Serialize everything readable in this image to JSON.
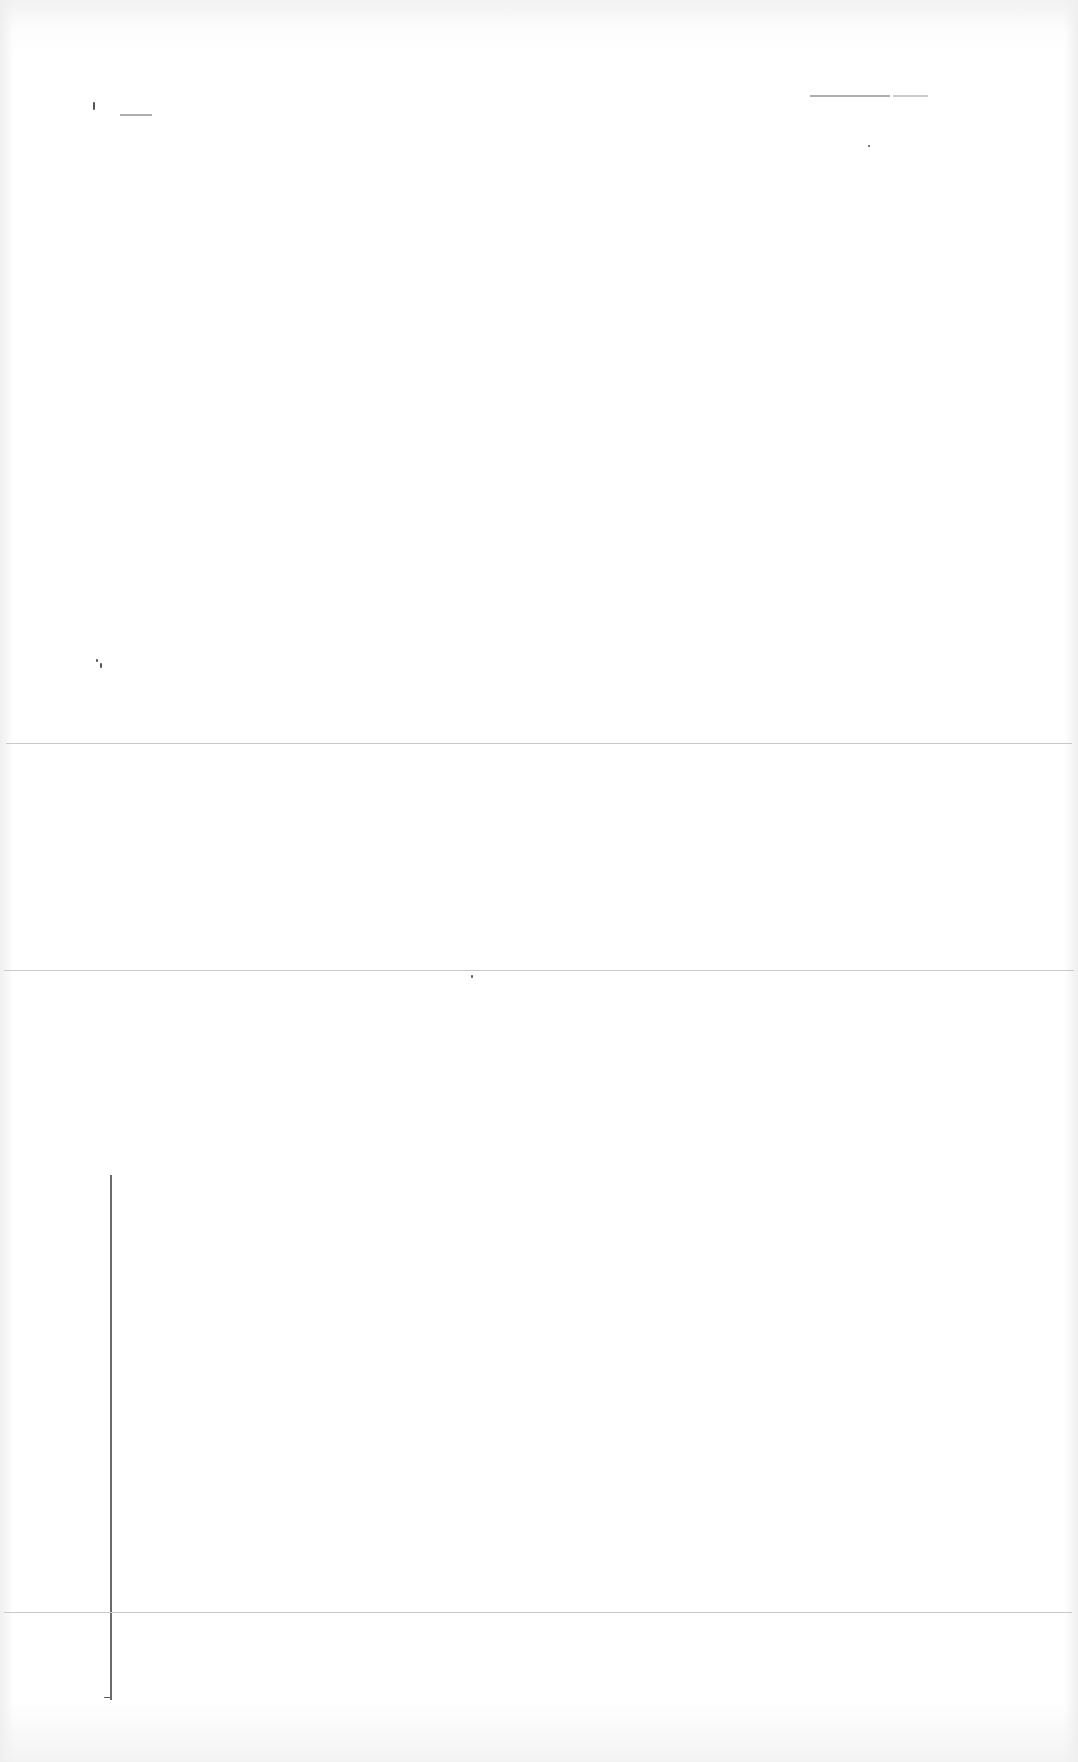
{
  "document": {
    "type": "scanned-page",
    "legibility": "illegible",
    "background": "#ffffff",
    "rule_color": "#c9c9c9",
    "axis_color": "#6a6a6a"
  },
  "header": {
    "left_mark": "",
    "right_mark": ""
  },
  "sections": [
    {
      "name": "top-section",
      "text": ""
    },
    {
      "name": "middle-section",
      "text": ""
    },
    {
      "name": "lower-section",
      "text": ""
    },
    {
      "name": "footer-section",
      "text": ""
    }
  ],
  "figure": {
    "label": ""
  }
}
